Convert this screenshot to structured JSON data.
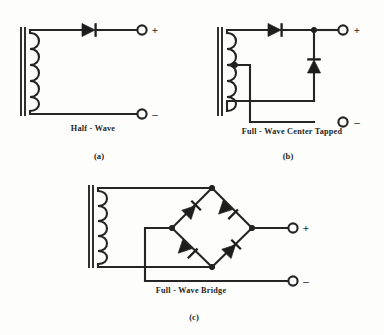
{
  "figure": {
    "background_color": "#fdfdfb",
    "ink_color": "#252525"
  },
  "circuits": [
    {
      "id": "half-wave",
      "caption": "Half - Wave",
      "subfigure_label": "(a)",
      "transformer": {
        "type": "core-and-coil",
        "core_lines": 2,
        "coil_loops": 5,
        "center_tapped": false
      },
      "diodes": [
        {
          "id": "d1",
          "orientation": "right",
          "position": "top-rail"
        }
      ],
      "terminals": [
        {
          "id": "out-pos",
          "polarity": "+",
          "position": "top-right"
        },
        {
          "id": "out-neg",
          "polarity": "–",
          "position": "bottom-right"
        }
      ]
    },
    {
      "id": "full-wave-center-tapped",
      "caption": "Full - Wave   Center  Tapped",
      "subfigure_label": "(b)",
      "transformer": {
        "type": "core-and-coil",
        "core_lines": 2,
        "coil_loops": 5,
        "center_tapped": true
      },
      "diodes": [
        {
          "id": "d1",
          "orientation": "right",
          "position": "top-rail"
        },
        {
          "id": "d2",
          "orientation": "up",
          "position": "vertical-branch"
        }
      ],
      "terminals": [
        {
          "id": "out-pos",
          "polarity": "+",
          "position": "top-right"
        },
        {
          "id": "out-neg",
          "polarity": "–",
          "position": "bottom-right"
        }
      ]
    },
    {
      "id": "full-wave-bridge",
      "caption": "Full - Wave  Bridge",
      "subfigure_label": "(c)",
      "transformer": {
        "type": "core-and-coil",
        "core_lines": 2,
        "coil_loops": 5,
        "center_tapped": false
      },
      "diodes": [
        {
          "id": "d1",
          "orientation": "up-right",
          "position": "bridge-top-left"
        },
        {
          "id": "d2",
          "orientation": "down-right",
          "position": "bridge-top-right"
        },
        {
          "id": "d3",
          "orientation": "down-right",
          "position": "bridge-bottom-left"
        },
        {
          "id": "d4",
          "orientation": "up-right",
          "position": "bridge-bottom-right"
        }
      ],
      "terminals": [
        {
          "id": "out-pos",
          "polarity": "+",
          "position": "middle-right"
        },
        {
          "id": "out-neg",
          "polarity": "–",
          "position": "bottom-right"
        }
      ]
    }
  ],
  "labels": {
    "half_wave_caption": "Half - Wave",
    "half_wave_subfig": "(a)",
    "half_wave_plus": "+",
    "half_wave_minus": "–",
    "center_tapped_caption": "Full - Wave   Center  Tapped",
    "center_tapped_subfig": "(b)",
    "center_tapped_plus": "+",
    "center_tapped_minus": "–",
    "bridge_caption": "Full - Wave  Bridge",
    "bridge_subfig": "(c)",
    "bridge_plus": "+",
    "bridge_minus": "–"
  }
}
